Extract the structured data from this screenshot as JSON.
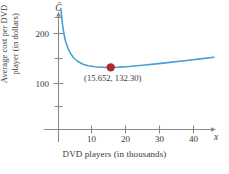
{
  "figure": {
    "background_color": "#ffffff",
    "axis_color": "#8a8a8a",
    "text_color": "#3a3a3a"
  },
  "chart_data": {
    "type": "line",
    "title": "",
    "subtitle": "",
    "xlabel": "DVD players (in thousands)",
    "ylabel_line1": "Average cost per DVD",
    "ylabel_line2": "player (in dollars)",
    "x_axis_variable": "x",
    "y_axis_variable": "C̄",
    "xlim": [
      0,
      48
    ],
    "ylim": [
      0,
      250
    ],
    "xticks": [
      10,
      20,
      30,
      40
    ],
    "xtick_labels": [
      "10",
      "20",
      "30",
      "40"
    ],
    "yticks": [
      100,
      200
    ],
    "ytick_labels": [
      "100",
      "200"
    ],
    "y_minor_ticks": [
      50,
      150,
      250
    ],
    "grid": false,
    "legend": null,
    "series": [
      {
        "name": "Average cost",
        "color": "#4a9fd4",
        "x": [
          1.0,
          1.4,
          1.8,
          2.3,
          3.0,
          3.8,
          4.8,
          6.0,
          7.5,
          9.0,
          11.0,
          13.0,
          15.652,
          18.0,
          21.0,
          25.0,
          29.0,
          33.0,
          38.0,
          42.0,
          46.0
        ],
        "y": [
          250.0,
          222.0,
          203.0,
          186.0,
          172.0,
          160.0,
          151.0,
          144.0,
          138.5,
          135.6,
          133.4,
          132.5,
          132.3,
          132.8,
          134.0,
          136.4,
          139.2,
          142.2,
          146.1,
          149.3,
          152.5
        ]
      }
    ],
    "annotations": [
      {
        "name": "minimum-point",
        "label": "(15.652, 132.30)",
        "x": 15.652,
        "y": 132.3,
        "marker_color": "#b02a2a",
        "marker_size": 4.2
      }
    ]
  }
}
